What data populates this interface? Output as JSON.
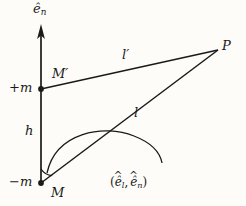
{
  "figure": {
    "type": "vector-geometry-diagram",
    "background_color": "#fdfcf8",
    "ink_color": "#1a1a1a",
    "width": 246,
    "height": 206
  },
  "labels": {
    "axis_unit_normal": "ê",
    "axis_unit_normal_sub": "n",
    "point_P": "P",
    "distance_upper": "l",
    "distance_upper_prime": "′",
    "point_M_prime": "M",
    "point_M_prime_mark": "′",
    "charge_positive": "+m",
    "distance_lower": "l",
    "height": "h",
    "charge_negative": "−m",
    "point_M": "M",
    "angle_open": "(",
    "angle_e1": "ê",
    "angle_e1_sub": "l",
    "angle_comma": ",",
    "angle_e2": "ê",
    "angle_e2_sub": "n",
    "angle_close": ")"
  },
  "geometry": {
    "axis": {
      "x": 41,
      "y_top": 25,
      "y_bottom": 184,
      "arrow": "up"
    },
    "point_M": {
      "x": 41,
      "y": 183,
      "label": "−m / M"
    },
    "point_M_prime": {
      "x": 41,
      "y": 89,
      "label": "+m / M′"
    },
    "point_P": {
      "x": 218,
      "y": 50
    },
    "segment_l_prime": {
      "from": "M′",
      "to": "P"
    },
    "segment_l": {
      "from": "M",
      "to": "P"
    },
    "angle_arc_small": {
      "center": "M",
      "radius": 14
    },
    "angle_arc_large": {
      "center": "M",
      "radius": 76
    }
  }
}
